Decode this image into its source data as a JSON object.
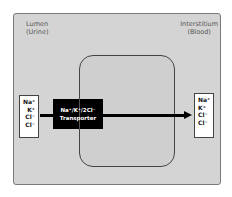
{
  "regions": {
    "lumen": {
      "line1": "Lumen",
      "line2": "(Urine)"
    },
    "interstitium": {
      "line1": "Interstitium",
      "line2": "(Blood)"
    }
  },
  "left_ions": [
    "Na⁺",
    "K⁺",
    "Cl⁻",
    "Cl⁻"
  ],
  "right_ions": [
    "Na⁺",
    "K⁺",
    "Cl⁻",
    "Cl⁻"
  ],
  "transporter": {
    "line1": "Na⁺/K⁺/2Cl⁻",
    "line2": "Transporter"
  },
  "colors": {
    "panel": "#d4d4d4",
    "cell": "#cfcfcf",
    "transporter": "#000000",
    "arrow": "#000000"
  }
}
